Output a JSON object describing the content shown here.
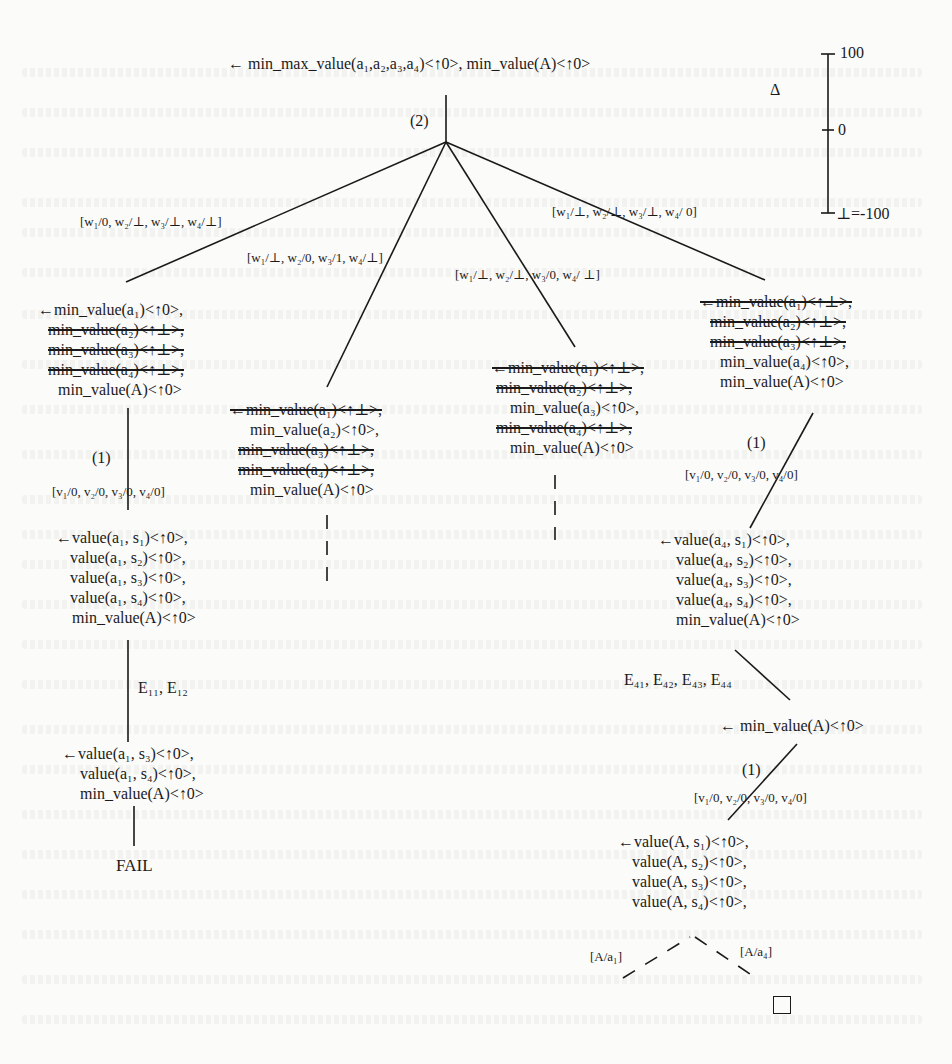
{
  "root": {
    "goal": "← min_max_value(a₁,a₂,a₃,a₄)<↑0>, min_value(A)<↑0>",
    "step_label": "(2)"
  },
  "scale": {
    "delta_symbol": "Δ",
    "top": "100",
    "middle": "0",
    "bottom": "⊥=-100"
  },
  "branches": [
    {
      "substitution": "[w₁/0, w₂/⊥, w₃/⊥, w₄/⊥]",
      "goal_lines": [
        {
          "text": "←min_value(a₁)<↑0>,",
          "struck": false
        },
        {
          "text": "min_value(a₂)<↑⊥>,",
          "struck": true
        },
        {
          "text": "min_value(a₃)<↑⊥>,",
          "struck": true
        },
        {
          "text": "min_value(a₄)<↑⊥>,",
          "struck": true
        },
        {
          "text": "min_value(A)<↑0>",
          "struck": false
        }
      ],
      "step1": {
        "step_label": "(1)",
        "substitution": "[v₁/0, v₂/0, v₃/0, v₄/0]",
        "goal_lines": [
          "←value(a₁, s₁)<↑0>,",
          "value(a₁, s₂)<↑0>,",
          "value(a₁, s₃)<↑0>,",
          "value(a₁, s₄)<↑0>,",
          "min_value(A)<↑0>"
        ]
      },
      "step2": {
        "edge_label": "E₁₁, E₁₂",
        "goal_lines": [
          "←value(a₁, s₃)<↑0>,",
          "value(a₁, s₄)<↑0>,",
          "min_value(A)<↑0>"
        ]
      },
      "result": "FAIL"
    },
    {
      "substitution": "[w₁/⊥, w₂/0, w₃/1, w₄/⊥]",
      "goal_lines": [
        {
          "text": "←min_value(a₁)<↑⊥>,",
          "struck": true
        },
        {
          "text": "min_value(a₂)<↑0>,",
          "struck": false
        },
        {
          "text": "min_value(a₃)<↑⊥>,",
          "struck": true
        },
        {
          "text": "min_value(a₄)<↑⊥>,",
          "struck": true
        },
        {
          "text": "min_value(A)<↑0>",
          "struck": false
        }
      ]
    },
    {
      "substitution": "[w₁/⊥, w₂/⊥, w₃/0, w₄/ ⊥]",
      "goal_lines": [
        {
          "text": "←min_value(a₁)<↑⊥>,",
          "struck": true
        },
        {
          "text": "min_value(a₂)<↑⊥>,",
          "struck": true
        },
        {
          "text": "min_value(a₃)<↑0>,",
          "struck": false
        },
        {
          "text": "min_value(a₄)<↑⊥>,",
          "struck": true
        },
        {
          "text": "min_value(A)<↑0>",
          "struck": false
        }
      ]
    },
    {
      "substitution": "[w₁/⊥, w₂/⊥, w₃/⊥, w₄/ 0]",
      "goal_lines": [
        {
          "text": "←min_value(a₁)<↑⊥>,",
          "struck": true
        },
        {
          "text": "min_value(a₂)<↑⊥>,",
          "struck": true
        },
        {
          "text": "min_value(a₃)<↑⊥>,",
          "struck": true
        },
        {
          "text": "min_value(a₄)<↑0>,",
          "struck": false
        },
        {
          "text": "min_value(A)<↑0>",
          "struck": false
        }
      ],
      "step1": {
        "step_label": "(1)",
        "substitution": "[v₁/0, v₂/0, v₃/0, v₄/0]",
        "goal_lines": [
          "←value(a₄, s₁)<↑0>,",
          "value(a₄, s₂)<↑0>,",
          "value(a₄, s₃)<↑0>,",
          "value(a₄, s₄)<↑0>,",
          "min_value(A)<↑0>"
        ]
      },
      "step2": {
        "edge_label": "E₄₁, E₄₂, E₄₃, E₄₄",
        "goal": "← min_value(A)<↑0>"
      },
      "step3": {
        "step_label": "(1)",
        "substitution": "[v₁/0, v₂/0, v₃/0, v₄/0]",
        "goal_lines": [
          "←value(A, s₁)<↑0>,",
          "value(A, s₂)<↑0>,",
          "value(A, s₃)<↑0>,",
          "value(A, s₄)<↑0>,"
        ]
      },
      "final_branches": [
        "[A/a₁]",
        "[A/a₄]"
      ],
      "result_symbol": "□"
    }
  ]
}
